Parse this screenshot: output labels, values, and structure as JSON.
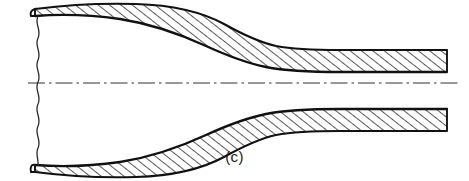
{
  "figure": {
    "caption": "(c)",
    "colors": {
      "background": "#ffffff",
      "outline": "#111111",
      "hatch": "#1a1a1a",
      "centerline": "#333333"
    },
    "geometry": {
      "view_width": 469,
      "view_height": 181,
      "axis_y": 83,
      "break_line_x": 38,
      "left_end_x": 33,
      "right_end_x": 447,
      "throat_x": 287,
      "large_bore_half_height": 45,
      "small_bore_half_height": 12,
      "wall_thickness_left": 22,
      "wall_thickness_right": 22
    },
    "elements": [
      {
        "name": "upper-wall-section",
        "label": "Upper wall (hatched section)"
      },
      {
        "name": "lower-wall-section",
        "label": "Lower wall (hatched section)"
      },
      {
        "name": "center-axis-line",
        "label": "Axis of revolution (dash-dot centerline)"
      },
      {
        "name": "break-line",
        "label": "Wavy break line at left end"
      },
      {
        "name": "figure-caption",
        "label": "(c)"
      }
    ]
  }
}
